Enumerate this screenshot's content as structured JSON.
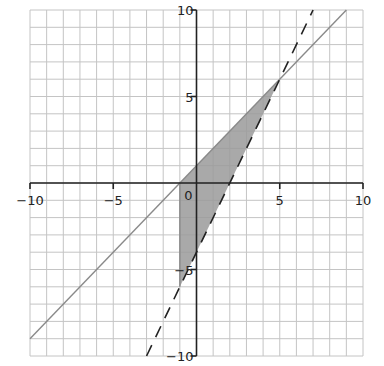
{
  "chart_data": {
    "type": "line",
    "title": "",
    "xlabel": "",
    "ylabel": "",
    "xlim": [
      -10,
      10
    ],
    "ylim": [
      -10,
      10
    ],
    "grid": true,
    "grid_step": 1,
    "x_ticks": [
      {
        "value": -10,
        "label": "−10"
      },
      {
        "value": -5,
        "label": "−5"
      },
      {
        "value": 5,
        "label": "5"
      },
      {
        "value": 10,
        "label": "10"
      }
    ],
    "y_ticks": [
      {
        "value": 10,
        "label": "10"
      },
      {
        "value": 5,
        "label": "5"
      },
      {
        "value": -5,
        "label": "−5"
      },
      {
        "value": -10,
        "label": "−10"
      }
    ],
    "origin_label": "0",
    "series": [
      {
        "name": "y = x + 1",
        "style": "solid",
        "color": "#8a8a8a",
        "points": [
          [
            -10,
            -9
          ],
          [
            9,
            10
          ]
        ]
      },
      {
        "name": "y = 2x - 4",
        "style": "dashed",
        "color": "#222222",
        "points": [
          [
            -3,
            -10
          ],
          [
            7,
            10
          ]
        ]
      },
      {
        "name": "x = -1",
        "style": "solid",
        "color": "#8a8a8a",
        "points": [
          [
            -1,
            0
          ],
          [
            -1,
            -6
          ]
        ]
      }
    ],
    "shaded_region": {
      "description": "feasible region bounded by y <= x + 1, y > 2x - 4, x >= -1",
      "vertices": [
        [
          -1,
          0
        ],
        [
          5,
          6
        ],
        [
          -1,
          -6
        ]
      ],
      "color": "#9a9a9a"
    },
    "intersection_point": [
      5,
      6
    ]
  }
}
